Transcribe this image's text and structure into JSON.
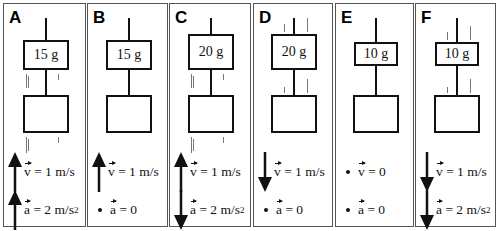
{
  "panels": [
    {
      "label": "A",
      "mass": "15 g",
      "v_dir": "up",
      "v_text": "= 1 m/s",
      "a_dir": "up",
      "a_text": "= 2 m/s",
      "a_sup": "2",
      "motion_lines": true
    },
    {
      "label": "B",
      "mass": "15 g",
      "v_dir": "up",
      "v_text": "= 1 m/s",
      "a_dir": "none",
      "a_text": "= 0",
      "a_sup": "",
      "motion_lines": false
    },
    {
      "label": "C",
      "mass": "20 g",
      "v_dir": "up",
      "v_text": "= 1 m/s",
      "a_dir": "down",
      "a_text": "= 2 m/s",
      "a_sup": "2",
      "motion_lines": true
    },
    {
      "label": "D",
      "mass": "20 g",
      "v_dir": "down",
      "v_text": "= 1 m/s",
      "a_dir": "none",
      "a_text": "= 0",
      "a_sup": "",
      "motion_lines": true
    },
    {
      "label": "E",
      "mass": "10 g",
      "v_dir": "none",
      "v_text": "= 0",
      "a_dir": "none",
      "a_text": "= 0",
      "a_sup": "",
      "motion_lines": false
    },
    {
      "label": "F",
      "mass": "10 g",
      "v_dir": "down",
      "v_text": "= 1 m/s",
      "a_dir": "down",
      "a_text": "= 2 m/s",
      "a_sup": "2",
      "motion_lines": true
    }
  ],
  "symbols": {
    "v": "v",
    "a": "a"
  }
}
